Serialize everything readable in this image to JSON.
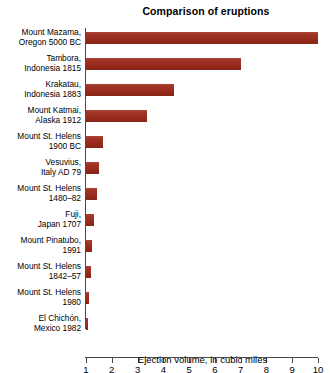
{
  "chart_data": {
    "type": "bar",
    "orientation": "horizontal",
    "title": "Comparison of eruptions",
    "xlabel": "Ejection volume, in cubic miles",
    "ylabel": "",
    "xlim": [
      1,
      10
    ],
    "xticks": [
      1,
      2,
      3,
      4,
      5,
      6,
      7,
      8,
      9,
      10
    ],
    "xtick_labels": [
      "1",
      "2",
      "3",
      "4",
      "5",
      "6",
      "7",
      "8",
      "9",
      "10"
    ],
    "grid": false,
    "legend": null,
    "bar_color": "#9c2a1b",
    "axis_color": "#4a4a4a",
    "categories": [
      "Mount Mazama,\nOregon 5000 BC",
      "Tambora,\nIndonesia 1815",
      "Krakatau,\nIndonesia 1883",
      "Mount Katmai,\nAlaska 1912",
      "Mount St. Helens\n1900 BC",
      "Vesuvius,\nItaly AD 79",
      "Mount St. Helens\n1480–82",
      "Fuji,\nJapan 1707",
      "Mount Pinatubo,\n1991",
      "Mount St. Helens\n1842–57",
      "Mount St. Helens\n1980",
      "El Chichón,\nMexico 1982"
    ],
    "values": [
      10.0,
      7.0,
      4.4,
      3.35,
      1.65,
      1.5,
      1.43,
      1.32,
      1.25,
      1.18,
      1.12,
      1.05
    ]
  }
}
